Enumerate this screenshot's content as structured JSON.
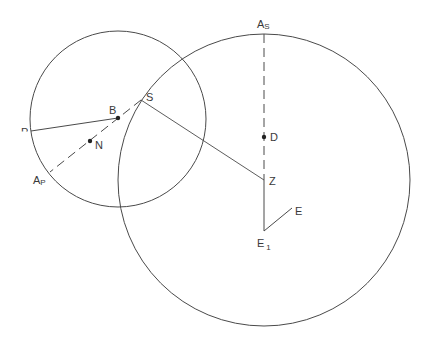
{
  "diagram": {
    "colors": {
      "stroke": "#4a4a4a",
      "text": "#3a3a3a",
      "background": "#ffffff"
    },
    "circles": [
      {
        "name": "small-circle",
        "cx": 118,
        "cy": 119,
        "r": 88
      },
      {
        "name": "large-circle",
        "cx": 264,
        "cy": 180,
        "r": 146
      }
    ],
    "points": {
      "S": {
        "x": 141,
        "y": 100
      },
      "B": {
        "x": 118,
        "y": 118
      },
      "N": {
        "x": 90,
        "y": 141
      },
      "P": {
        "x": 31,
        "y": 131
      },
      "AP": {
        "x": 50,
        "y": 172
      },
      "AS": {
        "x": 264,
        "y": 34
      },
      "D": {
        "x": 264,
        "y": 137
      },
      "Z": {
        "x": 264,
        "y": 180
      },
      "E1": {
        "x": 264,
        "y": 231
      },
      "E": {
        "x": 292,
        "y": 208
      }
    },
    "labels": {
      "S": "S",
      "B": "B",
      "N": "N",
      "P": "P",
      "A_main": "A",
      "AP_sub": "P",
      "AS_sub": "S",
      "D": "D",
      "Z": "Z",
      "E": "E",
      "E1_main": "E",
      "E1_sub": "1"
    }
  }
}
